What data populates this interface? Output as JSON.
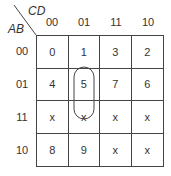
{
  "row_var": "AB",
  "col_var": "CD",
  "col_labels": [
    "00",
    "01",
    "11",
    "10"
  ],
  "row_labels": [
    "00",
    "01",
    "11",
    "10"
  ],
  "cells": [
    [
      "0",
      "1",
      "3",
      "2"
    ],
    [
      "4",
      "5",
      "7",
      "6"
    ],
    [
      "x",
      "x",
      "x",
      "x"
    ],
    [
      "8",
      "9",
      "x",
      "x"
    ]
  ],
  "grouping": {
    "cells": [
      "5",
      "x (row 11, col 01)"
    ],
    "note": "oval group covering minterm 5 and don't-care 13"
  }
}
